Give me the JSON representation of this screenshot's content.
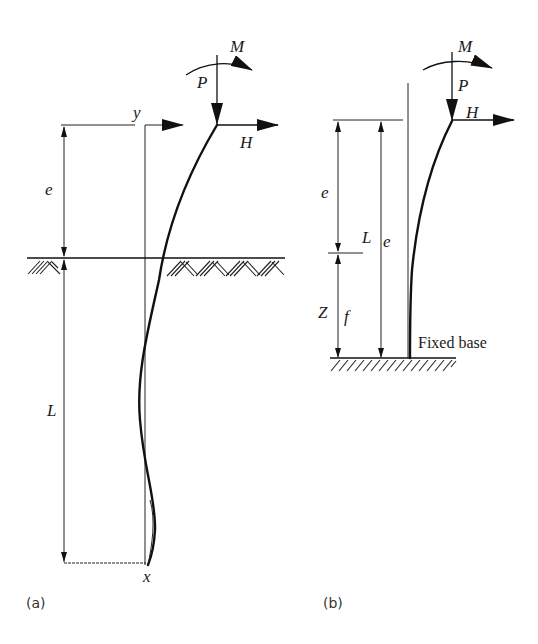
{
  "figure": {
    "panel_a": {
      "caption": "(a)",
      "labels": {
        "moment": "M",
        "axial_load": "P",
        "lateral_load": "H",
        "y_axis": "y",
        "x_axis": "x",
        "free_length": "e",
        "embedded_length": "L"
      },
      "ground": "soil surface with hatching"
    },
    "panel_b": {
      "caption": "(b)",
      "labels": {
        "moment": "M",
        "axial_load": "P",
        "lateral_load": "H",
        "free_length": "e",
        "total_length": "L",
        "total_length_sub": "e",
        "fixity_depth": "Z",
        "fixity_depth_sub": "f",
        "base_label": "Fixed base"
      }
    },
    "colors": {
      "line": "#222222",
      "background": "#ffffff"
    }
  }
}
